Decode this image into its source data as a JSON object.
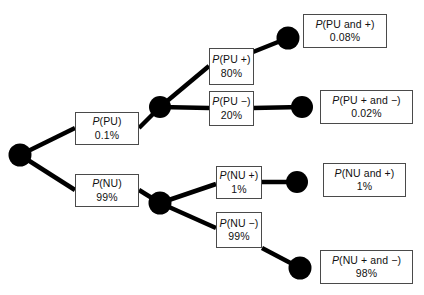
{
  "diagram": {
    "type": "probability-tree",
    "title": "",
    "colors": {
      "node_fill": "#000000",
      "edge": "#000000",
      "box_border": "#4a4a4a",
      "box_fill": "#ffffff",
      "text": "#111111"
    },
    "root": {
      "name": "root-node"
    },
    "branches": {
      "pu": {
        "prefix": "P",
        "name": "(PU)",
        "value": "0.1%"
      },
      "nu": {
        "prefix": "P",
        "name": "(NU)",
        "value": "99%"
      },
      "pu_pos": {
        "prefix": "P",
        "name": "(PU +)",
        "value": "80%"
      },
      "pu_neg": {
        "prefix": "P",
        "name": "(PU −)",
        "value": "20%"
      },
      "nu_pos": {
        "prefix": "P",
        "name": "(NU +)",
        "value": "1%"
      },
      "nu_neg": {
        "prefix": "P",
        "name": "(NU −)",
        "value": "99%"
      }
    },
    "outcomes": {
      "pu_and_pos": {
        "prefix": "P",
        "name": "(PU and +)",
        "value": "0.08%"
      },
      "pu_pos_and_neg": {
        "prefix": "P",
        "name": "(PU + and −)",
        "value": "0.02%"
      },
      "nu_and_pos": {
        "prefix": "P",
        "name": "(NU and +)",
        "value": "1%"
      },
      "nu_pos_and_neg": {
        "prefix": "P",
        "name": "(NU + and −)",
        "value": "98%"
      }
    }
  }
}
